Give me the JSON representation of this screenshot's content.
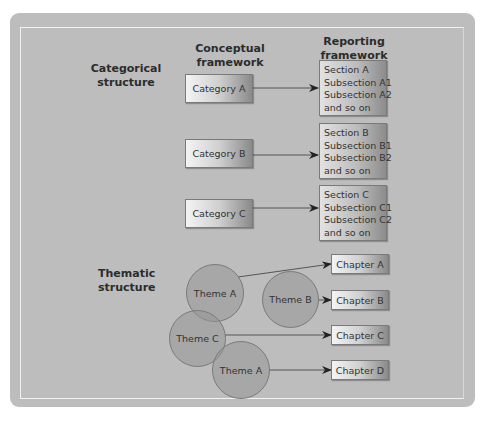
{
  "headers": {
    "conceptual": [
      "Conceptual",
      "framework"
    ],
    "reporting": [
      "Reporting",
      "framework"
    ]
  },
  "sections": {
    "categorical": [
      "Categorical",
      "structure"
    ],
    "thematic": [
      "Thematic",
      "structure"
    ]
  },
  "categories": [
    {
      "label": "Category A",
      "report": [
        "Section A",
        "Subsection A1",
        "Subsection A2",
        "and so on"
      ]
    },
    {
      "label": "Category B",
      "report": [
        "Section B",
        "Subsection B1",
        "Subsection B2",
        "and so on"
      ]
    },
    {
      "label": "Category C",
      "report": [
        "Section C",
        "Subsection C1",
        "Subsection C2",
        "and so on"
      ]
    }
  ],
  "themes": [
    "Theme A",
    "Theme B",
    "Theme C",
    "Theme A"
  ],
  "chapters": [
    "Chapter A",
    "Chapter B",
    "Chapter C",
    "Chapter D"
  ],
  "colors": {
    "panel": "#bdbdbd",
    "circle": "#969696",
    "line": "#555555"
  }
}
